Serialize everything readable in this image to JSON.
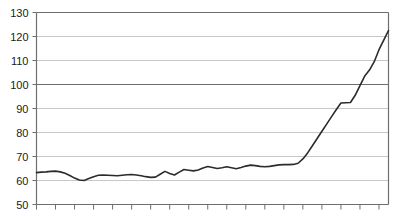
{
  "chart_data": {
    "type": "line",
    "title": "",
    "subtitle": "",
    "xlabel": "",
    "ylabel": "",
    "ylim": [
      50,
      130
    ],
    "ytick_values": [
      50,
      60,
      70,
      80,
      90,
      100,
      110,
      120,
      130
    ],
    "ytick_labels": [
      "50",
      "60",
      "70",
      "80",
      "90",
      "100",
      "110",
      "120",
      "130"
    ],
    "grid": true,
    "grid_color": "#c8c8c8",
    "emphasis_gridlines": [
      100,
      130
    ],
    "emphasis_grid_color": "#6e6e6e",
    "axis_color": "#6e6e6e",
    "line_color": "#2b2b2b",
    "line_width": 1.6,
    "legend": false,
    "legend_position": "none",
    "xlim": [
      0,
      74
    ],
    "x_major_tick_interval": 4,
    "x_tick_count": 19,
    "x_tick_labels": [],
    "x": [
      0,
      1,
      2,
      3,
      4,
      5,
      6,
      7,
      8,
      9,
      10,
      11,
      12,
      13,
      14,
      15,
      16,
      17,
      18,
      19,
      20,
      21,
      22,
      23,
      24,
      25,
      26,
      27,
      28,
      29,
      30,
      31,
      32,
      33,
      34,
      35,
      36,
      37,
      38,
      39,
      40,
      41,
      42,
      43,
      44,
      45,
      46,
      47,
      48,
      49,
      50,
      51,
      52,
      53,
      54,
      55,
      56,
      57,
      58,
      59,
      60,
      61,
      62,
      63,
      64,
      65,
      66,
      67,
      68,
      69,
      70,
      71,
      72,
      73,
      74
    ],
    "values": [
      63.3,
      63.5,
      63.6,
      63.8,
      63.9,
      63.6,
      63.0,
      62.1,
      61.0,
      60.2,
      60.0,
      60.8,
      61.6,
      62.2,
      62.3,
      62.2,
      62.1,
      62.0,
      62.2,
      62.4,
      62.5,
      62.3,
      62.0,
      61.6,
      61.3,
      61.4,
      62.6,
      63.8,
      62.9,
      62.3,
      63.5,
      64.6,
      64.3,
      64.0,
      64.4,
      65.2,
      65.8,
      65.4,
      65.0,
      65.3,
      65.7,
      65.3,
      64.9,
      65.4,
      66.0,
      66.4,
      66.2,
      65.9,
      65.7,
      65.9,
      66.2,
      66.5,
      66.6,
      66.6,
      66.7,
      67.2,
      69.0,
      71.5,
      74.5,
      77.5,
      80.5,
      83.5,
      86.5,
      89.5,
      92.3,
      92.4,
      92.5,
      95.5,
      99.5,
      103.5,
      106.0,
      109.5,
      114.5,
      118.5,
      122.5
    ],
    "series": [
      {
        "name": "series-1",
        "values": [
          63.3,
          63.5,
          63.6,
          63.8,
          63.9,
          63.6,
          63.0,
          62.1,
          61.0,
          60.2,
          60.0,
          60.8,
          61.6,
          62.2,
          62.3,
          62.2,
          62.1,
          62.0,
          62.2,
          62.4,
          62.5,
          62.3,
          62.0,
          61.6,
          61.3,
          61.4,
          62.6,
          63.8,
          62.9,
          62.3,
          63.5,
          64.6,
          64.3,
          64.0,
          64.4,
          65.2,
          65.8,
          65.4,
          65.0,
          65.3,
          65.7,
          65.3,
          64.9,
          65.4,
          66.0,
          66.4,
          66.2,
          65.9,
          65.7,
          65.9,
          66.2,
          66.5,
          66.6,
          66.6,
          66.7,
          67.2,
          69.0,
          71.5,
          74.5,
          77.5,
          80.5,
          83.5,
          86.5,
          89.5,
          92.3,
          92.4,
          92.5,
          95.5,
          99.5,
          103.5,
          106.0,
          109.5,
          114.5,
          118.5,
          122.5
        ]
      }
    ],
    "annotations": []
  }
}
